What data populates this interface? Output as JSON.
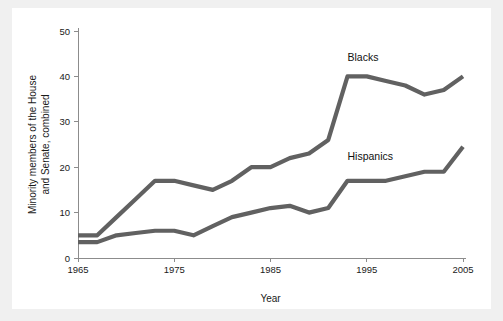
{
  "figure": {
    "background_color": "#f0f0f0",
    "panel_color": "#ffffff",
    "axis_color": "#8c8c8c",
    "text_color": "#1a1a1a"
  },
  "chart_data": {
    "type": "line",
    "title": "",
    "subtitle": "",
    "xlabel": "Year",
    "ylabel": "Minority members of the House and Senate, combined",
    "ylabel_line1": "Minority members of the House",
    "ylabel_line2": "and Senate, combined",
    "xlim": [
      1965,
      2005
    ],
    "ylim": [
      0,
      50
    ],
    "xticks": [
      1965,
      1975,
      1985,
      1995,
      2005
    ],
    "xtick_labels": [
      "1965",
      "1975",
      "1985",
      "1995",
      "2005"
    ],
    "yticks": [
      0,
      10,
      20,
      30,
      40,
      50
    ],
    "ytick_labels": [
      "0",
      "10",
      "20",
      "30",
      "40",
      "50"
    ],
    "grid": false,
    "legend_position": "inline-annotation",
    "series": [
      {
        "name": "Blacks",
        "color": "#616161",
        "label_x": 1993,
        "label_y": 43.5,
        "x": [
          1965,
          1967,
          1969,
          1971,
          1973,
          1975,
          1977,
          1979,
          1981,
          1983,
          1985,
          1987,
          1989,
          1991,
          1993,
          1995,
          1997,
          1999,
          2001,
          2003,
          2005
        ],
        "y": [
          5,
          5,
          9,
          13,
          17,
          17,
          16,
          15,
          17,
          20,
          20,
          22,
          23,
          26,
          40,
          40,
          39,
          38,
          36,
          37,
          40
        ]
      },
      {
        "name": "Hispanics",
        "color": "#616161",
        "label_x": 1993,
        "label_y": 21.5,
        "x": [
          1965,
          1967,
          1969,
          1971,
          1973,
          1975,
          1977,
          1979,
          1981,
          1983,
          1985,
          1987,
          1989,
          1991,
          1993,
          1995,
          1997,
          1999,
          2001,
          2003,
          2005
        ],
        "y": [
          3.5,
          3.5,
          5,
          5.5,
          6,
          6,
          5,
          7,
          9,
          10,
          11,
          11.5,
          10,
          11,
          17,
          17,
          17,
          18,
          19,
          19,
          24.5
        ]
      }
    ]
  },
  "annotations": {
    "blacks_label": "Blacks",
    "hispanics_label": "Hispanics"
  }
}
